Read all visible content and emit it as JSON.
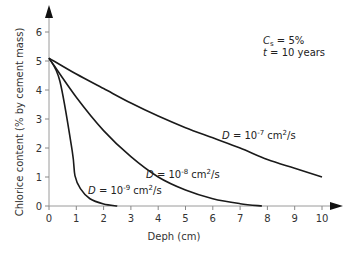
{
  "chart_data": {
    "type": "line",
    "title": "",
    "xlabel": "Deph (cm)",
    "ylabel": "Chlorice content (% by cement mass)",
    "xlim": [
      0,
      10
    ],
    "ylim": [
      0,
      6
    ],
    "x_ticks": [
      0,
      1,
      2,
      3,
      4,
      5,
      6,
      7,
      8,
      9,
      10
    ],
    "y_ticks": [
      0,
      1,
      2,
      3,
      4,
      5,
      6
    ],
    "grid": false,
    "annotations": {
      "cs": "Cs = 5%",
      "t": "t = 10 years"
    },
    "series": [
      {
        "name": "D = 10^-7 cm2/s",
        "x": [
          0,
          1,
          2,
          3,
          4,
          5,
          6,
          7,
          8,
          9,
          10
        ],
        "y": [
          5.1,
          4.55,
          4.05,
          3.55,
          3.1,
          2.7,
          2.35,
          2.0,
          1.6,
          1.3,
          1.0
        ]
      },
      {
        "name": "D = 10^-8 cm2/s",
        "x": [
          0,
          1,
          2,
          3,
          4,
          5,
          6,
          7,
          7.8
        ],
        "y": [
          5.1,
          3.75,
          2.6,
          1.7,
          1.0,
          0.55,
          0.25,
          0.08,
          0.0
        ]
      },
      {
        "name": "D = 10^-9 cm2/s",
        "x": [
          0,
          0.4,
          0.85,
          0.95,
          1.15,
          1.5,
          2.0,
          2.5
        ],
        "y": [
          5.1,
          4.3,
          1.9,
          1.05,
          0.6,
          0.25,
          0.07,
          0.0
        ]
      }
    ]
  },
  "labels": {
    "ylabel": "Chlorice content (% by cement mass)",
    "xlabel": "Deph (cm)",
    "cs_symbol": "C",
    "cs_sub": "s",
    "cs_value": " = 5%",
    "t_symbol": "t",
    "t_value": " = 10 years",
    "d7_prefix": "D",
    "d7_mid": " = 10",
    "d7_exp": "-7",
    "d7_unit": " cm",
    "d7_unit_exp": "2",
    "d7_tail": "/s",
    "d8_prefix": "D",
    "d8_mid": " = 10",
    "d8_exp": "-8",
    "d8_unit": " cm",
    "d8_unit_exp": "2",
    "d8_tail": "/s",
    "d9_prefix": "D",
    "d9_mid": " = 10",
    "d9_exp": "-9",
    "d9_unit": " cm",
    "d9_unit_exp": "2",
    "d9_tail": "/s"
  }
}
